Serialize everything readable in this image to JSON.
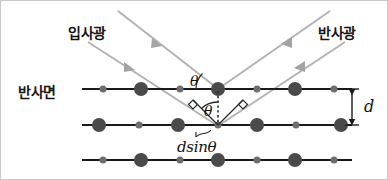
{
  "diagram": {
    "labels": {
      "incident": "입사광",
      "reflected": "반사광",
      "surface": "반사면",
      "theta_top": "θ",
      "theta_bottom": "θ",
      "spacing": "d",
      "path_difference": "dsinθ"
    },
    "colors": {
      "ray": "#b3b3b3",
      "atom_large": "#4a4a4a",
      "atom_small": "#6e6e6e",
      "plane_line": "#1a1a1a",
      "text": "#141414",
      "background": "#ffffff",
      "border": "#c8c8c8"
    },
    "geometry": {
      "planes_y": [
        89,
        125,
        160
      ],
      "plane_x_start": 82,
      "plane_x_end": 352,
      "interplanar_spacing_px": 36,
      "scatter_top": [
        218,
        89
      ],
      "scatter_bottom": [
        218,
        125
      ],
      "incidence_angle_deg": 45,
      "atom_large_radius": 7,
      "atom_small_radius": 3.5,
      "atom_pitch": 38
    },
    "rows": [
      {
        "name": "top-plane",
        "atoms": [
          {
            "x": 103,
            "size": "small"
          },
          {
            "x": 141,
            "size": "large"
          },
          {
            "x": 180,
            "size": "small"
          },
          {
            "x": 218,
            "size": "large"
          },
          {
            "x": 257,
            "size": "small"
          },
          {
            "x": 295,
            "size": "large"
          },
          {
            "x": 334,
            "size": "small"
          }
        ]
      },
      {
        "name": "middle-plane",
        "atoms": [
          {
            "x": 99,
            "size": "large"
          },
          {
            "x": 139,
            "size": "small"
          },
          {
            "x": 178,
            "size": "large"
          },
          {
            "x": 218,
            "size": "small"
          },
          {
            "x": 257,
            "size": "large"
          },
          {
            "x": 296,
            "size": "small"
          },
          {
            "x": 341,
            "size": "large"
          }
        ]
      },
      {
        "name": "bottom-plane",
        "atoms": [
          {
            "x": 103,
            "size": "small"
          },
          {
            "x": 141,
            "size": "large"
          },
          {
            "x": 180,
            "size": "small"
          },
          {
            "x": 218,
            "size": "large"
          },
          {
            "x": 257,
            "size": "small"
          },
          {
            "x": 295,
            "size": "large"
          },
          {
            "x": 334,
            "size": "small"
          }
        ]
      }
    ]
  }
}
